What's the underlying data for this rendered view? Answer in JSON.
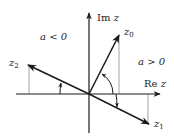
{
  "diagram": {
    "axes": {
      "real_label": "Re z",
      "imag_label": "Im z",
      "real_prefix": "Re",
      "imag_prefix": "Im",
      "variable": "z"
    },
    "regions": {
      "left": "a < 0",
      "right": "a > 0"
    },
    "vectors": [
      {
        "name": "z0",
        "base": "z",
        "sub": "0"
      },
      {
        "name": "z1",
        "base": "z",
        "sub": "1"
      },
      {
        "name": "z2",
        "base": "z",
        "sub": "2"
      }
    ],
    "colors": {
      "stroke": "#1a1a1a",
      "thin": "#555555",
      "text": "#222222"
    }
  }
}
